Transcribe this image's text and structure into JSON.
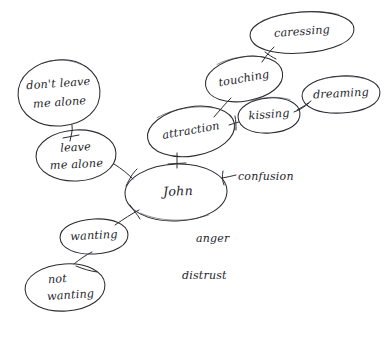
{
  "diagram": {
    "background_color": "#ffffff",
    "ink_color": "#2b2b33",
    "style": "handwritten-sketch",
    "nodes": [
      {
        "id": "dont-leave-me-alone",
        "line1": "don't leave",
        "line2": "me alone",
        "shape": "ellipse",
        "cx": 59,
        "cy": 93,
        "rx": 41,
        "ry": 33,
        "rotate": -4
      },
      {
        "id": "leave-me-alone",
        "line1": "leave",
        "line2": "me alone",
        "shape": "ellipse",
        "cx": 76,
        "cy": 155,
        "rx": 40,
        "ry": 25,
        "rotate": -3
      },
      {
        "id": "john",
        "line1": "John",
        "line2": "",
        "shape": "ellipse",
        "cx": 176,
        "cy": 192,
        "rx": 51,
        "ry": 28,
        "rotate": -2
      },
      {
        "id": "wanting",
        "line1": "wanting",
        "line2": "",
        "shape": "ellipse",
        "cx": 94,
        "cy": 236,
        "rx": 34,
        "ry": 17,
        "rotate": -3
      },
      {
        "id": "not-wanting",
        "line1": "not",
        "line2": "wanting",
        "shape": "ellipse",
        "cx": 65,
        "cy": 287,
        "rx": 40,
        "ry": 23,
        "rotate": -4
      },
      {
        "id": "attraction",
        "line1": "attraction",
        "line2": "",
        "shape": "ellipse",
        "cx": 191,
        "cy": 131,
        "rx": 44,
        "ry": 24,
        "rotate": -10
      },
      {
        "id": "touching",
        "line1": "touching",
        "line2": "",
        "shape": "ellipse",
        "cx": 244,
        "cy": 79,
        "rx": 39,
        "ry": 22,
        "rotate": -10
      },
      {
        "id": "kissing",
        "line1": "kissing",
        "line2": "",
        "shape": "ellipse",
        "cx": 269,
        "cy": 115,
        "rx": 31,
        "ry": 17,
        "rotate": -4
      },
      {
        "id": "caressing",
        "line1": "caressing",
        "line2": "",
        "shape": "ellipse",
        "cx": 302,
        "cy": 32,
        "rx": 52,
        "ry": 20,
        "rotate": -4
      },
      {
        "id": "dreaming",
        "line1": "dreaming",
        "line2": "",
        "shape": "ellipse",
        "cx": 341,
        "cy": 94,
        "rx": 39,
        "ry": 18,
        "rotate": -3
      }
    ],
    "free_labels": [
      {
        "id": "confusion",
        "text": "confusion",
        "x": 238,
        "y": 177
      },
      {
        "id": "anger",
        "text": "anger",
        "x": 196,
        "y": 239
      },
      {
        "id": "distrust",
        "text": "distrust",
        "x": 182,
        "y": 276
      }
    ],
    "edges": [
      {
        "id": "dont-leave-to-leave",
        "from": "dont-leave-me-alone",
        "to": "leave-me-alone"
      },
      {
        "id": "leave-to-john",
        "from": "leave-me-alone",
        "to": "john"
      },
      {
        "id": "attraction-to-john",
        "from": "attraction",
        "to": "john"
      },
      {
        "id": "wanting-to-john",
        "from": "wanting",
        "to": "john"
      },
      {
        "id": "not-wanting-to-wanting",
        "from": "not-wanting",
        "to": "wanting"
      },
      {
        "id": "attraction-to-touching",
        "from": "attraction",
        "to": "touching"
      },
      {
        "id": "attraction-to-kissing",
        "from": "attraction",
        "to": "kissing"
      },
      {
        "id": "touching-to-caressing",
        "from": "touching",
        "to": "caressing"
      },
      {
        "id": "kissing-to-dreaming",
        "from": "kissing",
        "to": "dreaming"
      },
      {
        "id": "john-to-confusion",
        "from": "john",
        "to": "confusion"
      }
    ]
  }
}
